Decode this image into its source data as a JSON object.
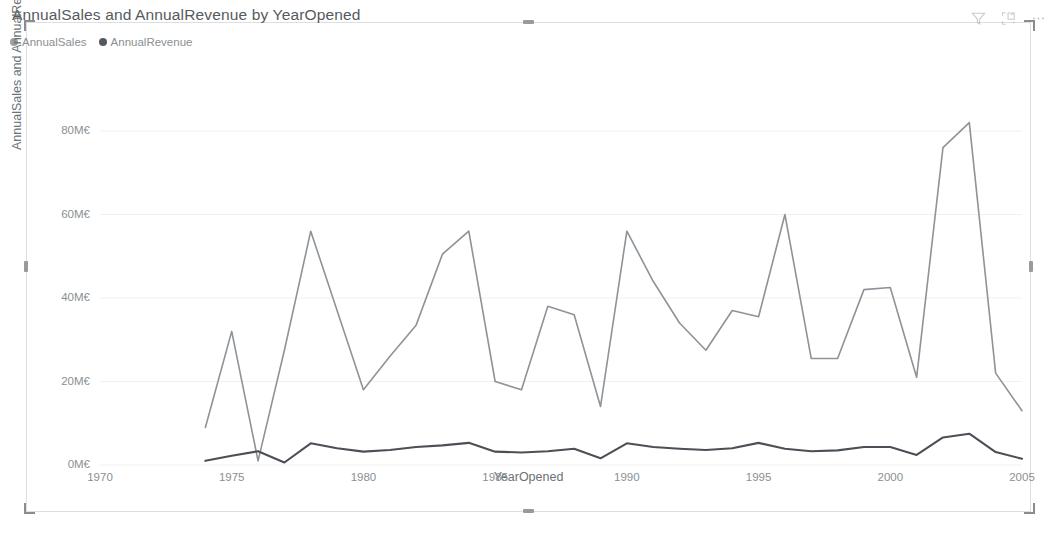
{
  "visual": {
    "title": "AnnualSales and AnnualRevenue by YearOpened",
    "header_icons": [
      {
        "name": "filter-icon",
        "label": "Filters"
      },
      {
        "name": "focus-mode-icon",
        "label": "Focus mode"
      },
      {
        "name": "more-options-icon",
        "label": "More options"
      }
    ]
  },
  "legend": {
    "items": [
      {
        "label": "AnnualSales",
        "color": "#9aa0a5"
      },
      {
        "label": "AnnualRevenue",
        "color": "#545a60"
      }
    ]
  },
  "colors": {
    "annual_sales_line": "#8d9399",
    "annual_revenue_line": "#4b5056",
    "gridline": "#f0f0f0",
    "axis_text": "#8a8f93",
    "title_text": "#555a5e",
    "frame_border": "#dedede"
  },
  "chart_data": {
    "type": "line",
    "title": "AnnualSales and AnnualRevenue by YearOpened",
    "xlabel": "YearOpened",
    "ylabel": "AnnualSales and AnnualRevenue",
    "grid": true,
    "legend_position": "top-left",
    "xlim": [
      1970,
      2005
    ],
    "ylim": [
      0,
      88
    ],
    "yticks": [
      0,
      20,
      40,
      60,
      80
    ],
    "ytick_labels": [
      "0M€",
      "20M€",
      "40M€",
      "60M€",
      "80M€"
    ],
    "xticks": [
      1970,
      1975,
      1980,
      1985,
      1990,
      1995,
      2000,
      2005
    ],
    "xtick_labels": [
      "1970",
      "1975",
      "1980",
      "1985",
      "1990",
      "1995",
      "2000",
      "2005"
    ],
    "unit": "M€",
    "x": [
      1974,
      1975,
      1976,
      1977,
      1978,
      1979,
      1980,
      1981,
      1982,
      1983,
      1984,
      1985,
      1986,
      1987,
      1988,
      1989,
      1990,
      1991,
      1992,
      1993,
      1994,
      1995,
      1996,
      1997,
      1998,
      1999,
      2000,
      2001,
      2002,
      2003,
      2004,
      2005
    ],
    "series": [
      {
        "name": "AnnualSales",
        "color": "#8d9399",
        "values": [
          9.0,
          32.0,
          1.0,
          27.5,
          56.0,
          37.0,
          18.0,
          26.0,
          33.5,
          50.5,
          56.0,
          20.0,
          18.0,
          38.0,
          36.0,
          14.0,
          56.0,
          44.0,
          34.0,
          27.5,
          37.0,
          35.5,
          60.0,
          25.5,
          25.5,
          42.0,
          42.5,
          21.0,
          76.0,
          82.0,
          22.0,
          13.0
        ]
      },
      {
        "name": "AnnualRevenue",
        "color": "#4b5056",
        "values": [
          1.0,
          2.2,
          3.3,
          0.6,
          5.2,
          4.0,
          3.2,
          3.6,
          4.3,
          4.7,
          5.3,
          3.2,
          3.0,
          3.3,
          3.9,
          1.6,
          5.2,
          4.3,
          3.9,
          3.6,
          4.0,
          5.3,
          3.9,
          3.3,
          3.5,
          4.3,
          4.3,
          2.4,
          6.6,
          7.5,
          3.1,
          1.5
        ]
      }
    ]
  }
}
